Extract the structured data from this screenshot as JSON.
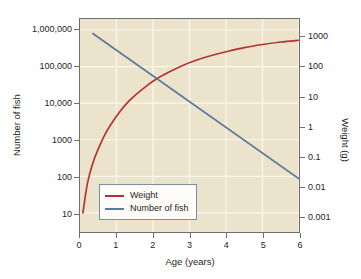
{
  "chart_data": {
    "type": "line",
    "title": "",
    "xlabel": "Age (years)",
    "ylabel": "Number of fish",
    "ylabel_right": "Weight (g)",
    "xlim": [
      0,
      6
    ],
    "xticks": [
      "0",
      "1",
      "2",
      "3",
      "4",
      "5",
      "6"
    ],
    "xtick_values": [
      0,
      1,
      2,
      3,
      4,
      5,
      6
    ],
    "yscale": "log",
    "ylim": [
      3,
      2000000
    ],
    "yticks": [
      "10",
      "100",
      "1000",
      "10,000",
      "100,000",
      "1,000,000"
    ],
    "ytick_values": [
      10,
      100,
      1000,
      10000,
      100000,
      1000000
    ],
    "yscale_right": "log",
    "ylim_right": [
      0.0003,
      4000
    ],
    "yticks_right": [
      "1000",
      "100",
      "10",
      "1",
      "0.1",
      "0.01",
      "0.001"
    ],
    "ytick_values_right": [
      1000,
      100,
      10,
      1,
      0.1,
      0.01,
      0.001
    ],
    "grid": true,
    "legend_position": "lower-left-inside",
    "plot_background": "#ece3cd",
    "series": [
      {
        "name": "Weight",
        "axis": "right",
        "color": "#b5332e",
        "x": [
          0.08,
          0.2,
          0.35,
          0.5,
          0.7,
          0.9,
          1.1,
          1.3,
          1.5,
          1.8,
          2.1,
          2.4,
          2.8,
          3.2,
          3.6,
          4.0,
          4.5,
          5.0,
          5.5,
          6.0
        ],
        "y": [
          0.0013,
          0.012,
          0.06,
          0.18,
          0.6,
          1.5,
          3.3,
          6.4,
          11,
          22,
          40,
          64,
          110,
          170,
          240,
          320,
          440,
          560,
          680,
          780
        ]
      },
      {
        "name": "Number of fish",
        "axis": "left",
        "color": "#5b7b9a",
        "x": [
          0.35,
          6.0
        ],
        "y": [
          800000,
          85
        ]
      }
    ],
    "legend": [
      {
        "label": "Weight",
        "color": "#b5332e"
      },
      {
        "label": "Number of fish",
        "color": "#5b7b9a"
      }
    ],
    "annotations": [
      {
        "text": "curves cross at approximately 1.8 years",
        "x": 1.8,
        "y": 25000
      }
    ]
  }
}
